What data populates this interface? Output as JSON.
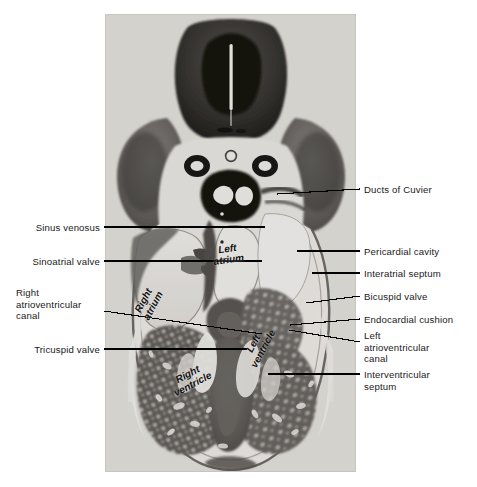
{
  "figure": {
    "kind": "histology-photomicrograph",
    "background_color": "#ffffff",
    "text_color": "#1a1a1a",
    "leader_color": "#000000"
  },
  "labels_left": [
    {
      "id": "sinus-venosus",
      "text": "Sinus venosus",
      "x": 28,
      "y": 222,
      "width": 72,
      "line_from_x": 104,
      "line_from_y": 227,
      "line_to_x": 265,
      "line_to_y": 227
    },
    {
      "id": "sinoatrial-valve",
      "text": "Sinoatrial valve",
      "x": 14,
      "y": 256,
      "width": 86,
      "line_from_x": 104,
      "line_from_y": 261,
      "line_to_x": 262,
      "line_to_y": 261
    },
    {
      "id": "right-atrioventricular-canal",
      "text": "Right\natrioventricular\ncanal",
      "x": 16,
      "y": 287,
      "width": 84,
      "line_from_x": 104,
      "line_from_y": 311,
      "line_to_x": 262,
      "line_to_y": 334
    },
    {
      "id": "tricuspid-valve",
      "text": "Tricuspid valve",
      "x": 21,
      "y": 344,
      "width": 79,
      "line_from_x": 104,
      "line_from_y": 349,
      "line_to_x": 247,
      "line_to_y": 349
    }
  ],
  "labels_right": [
    {
      "id": "ducts-of-cuvier",
      "text": "Ducts of Cuvier",
      "x": 364,
      "y": 184,
      "line_from_x": 360,
      "line_from_y": 189,
      "line_to_x": 277,
      "line_to_y": 194
    },
    {
      "id": "pericardial-cavity",
      "text": "Pericardial cavity",
      "x": 364,
      "y": 246,
      "line_from_x": 360,
      "line_from_y": 251,
      "line_to_x": 297,
      "line_to_y": 251
    },
    {
      "id": "interatrial-septum",
      "text": "Interatrial septum",
      "x": 364,
      "y": 268,
      "line_from_x": 360,
      "line_from_y": 273,
      "line_to_x": 312,
      "line_to_y": 273
    },
    {
      "id": "bicuspid-valve",
      "text": "Bicuspid valve",
      "x": 364,
      "y": 291,
      "line_from_x": 360,
      "line_from_y": 296,
      "line_to_x": 306,
      "line_to_y": 303
    },
    {
      "id": "endocardial-cushion",
      "text": "Endocardial cushion",
      "x": 364,
      "y": 314,
      "line_from_x": 360,
      "line_from_y": 319,
      "line_to_x": 290,
      "line_to_y": 325
    },
    {
      "id": "left-atrioventricular-canal",
      "text": "Left\natrioventricular\ncanal",
      "x": 364,
      "y": 330,
      "line_from_x": 360,
      "line_from_y": 342,
      "line_to_x": 289,
      "line_to_y": 330
    },
    {
      "id": "interventricular-septum",
      "text": "Interventricular\nseptum",
      "x": 364,
      "y": 369,
      "line_from_x": 360,
      "line_from_y": 374,
      "line_to_x": 268,
      "line_to_y": 374
    }
  ],
  "labels_in_photo": [
    {
      "id": "left-atrium",
      "text": "Left\natrium",
      "x": 228,
      "y": 243,
      "rotate": -8
    },
    {
      "id": "right-atrium",
      "text": "Right\natrium",
      "x": 148,
      "y": 292,
      "rotate": -62
    },
    {
      "id": "left-ventricle",
      "text": "Left\nventricle",
      "x": 258,
      "y": 335,
      "rotate": -62
    },
    {
      "id": "right-ventricle",
      "text": "Right\nventricle",
      "x": 190,
      "y": 368,
      "rotate": -28
    }
  ]
}
